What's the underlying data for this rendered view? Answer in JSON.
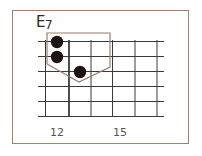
{
  "chord": {
    "name": "E",
    "quality": "7",
    "full_name": "E7"
  },
  "fretboard": {
    "strings": 6,
    "first_fret": 12,
    "frets_shown": 5,
    "fret_labels": [
      {
        "fret": 12,
        "label": "12"
      },
      {
        "fret": 15,
        "label": "15"
      }
    ]
  },
  "fingering": [
    {
      "string": 1,
      "fret": 12
    },
    {
      "string": 2,
      "fret": 12
    },
    {
      "string": 3,
      "fret": 13
    }
  ],
  "colors": {
    "frame": "#a3806c",
    "highlight_outline": "#9c7d6c",
    "grid": "#333333",
    "dot": "#1e1414",
    "background": "#ffffff"
  }
}
